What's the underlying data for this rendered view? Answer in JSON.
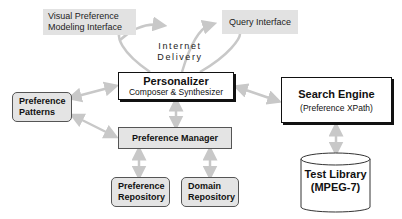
{
  "diagram": {
    "interfaces": {
      "visual_preference": [
        "Visual Preference",
        "Modeling Interface"
      ],
      "query": "Query Interface"
    },
    "delivery_label": [
      "Internet",
      "Delivery"
    ],
    "personalizer": {
      "title": "Personalizer",
      "subtitle": "Composer & Synthesizer"
    },
    "search_engine": {
      "title": "Search Engine",
      "subtitle": "(Preference XPath)"
    },
    "preference_patterns": [
      "Preference",
      "Patterns"
    ],
    "preference_manager": "Preference Manager",
    "preference_repository": [
      "Preference",
      "Repository"
    ],
    "domain_repository": [
      "Domain",
      "Repository"
    ],
    "test_library": [
      "Test Library",
      "(MPEG-7)"
    ],
    "colors": {
      "arrow": "#c8c8c8",
      "interface_fill": "#e2e2e2",
      "box_fill": "#e4e4e4",
      "border": "#111111"
    }
  }
}
